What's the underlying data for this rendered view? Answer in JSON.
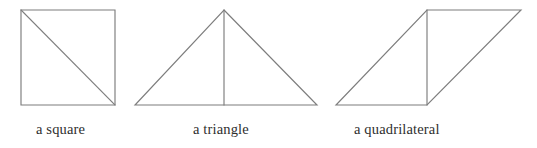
{
  "figure": {
    "background_color": "#ffffff",
    "stroke_color": "#7d7d7d",
    "text_color": "#2e2e2e",
    "width": 537,
    "height": 148
  },
  "shapes": [
    {
      "id": "square",
      "caption": "a square",
      "kind": "square-with-diagonal",
      "outline_points": "21,10 115,10 115,105 21,105",
      "interior_line": "21,10 115,105",
      "vertices": {
        "top_left": [
          21,
          10
        ],
        "top_right": [
          115,
          10
        ],
        "bottom_right": [
          115,
          105
        ],
        "bottom_left": [
          21,
          105
        ]
      }
    },
    {
      "id": "triangle",
      "caption": "a triangle",
      "kind": "isosceles-triangle-with-altitude",
      "outline_points": "224,10 317,105 135,105",
      "interior_line": "224,10 224,105",
      "vertices": {
        "apex": [
          224,
          10
        ],
        "base_left": [
          135,
          105
        ],
        "base_right": [
          317,
          105
        ]
      }
    },
    {
      "id": "quadrilateral",
      "caption": "a quadrilateral",
      "kind": "parallelogram-with-diagonal",
      "outline_points": "427,10 521,10 427,105 336,105",
      "interior_line": "427,10 427,105",
      "vertices": {
        "top_left": [
          427,
          10
        ],
        "top_right": [
          521,
          10
        ],
        "bottom_right": [
          427,
          105
        ],
        "bottom_left": [
          336,
          105
        ]
      }
    }
  ],
  "captions": {
    "square": "a square",
    "triangle": "a triangle",
    "quadrilateral": "a quadrilateral"
  }
}
